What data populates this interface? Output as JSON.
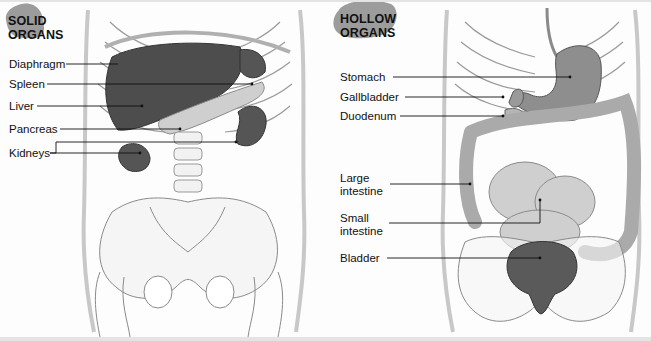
{
  "panels": [
    {
      "heading_line1": "SOLID",
      "heading_line2": "ORGANS",
      "labels": [
        {
          "text": "Diaphragm"
        },
        {
          "text": "Spleen"
        },
        {
          "text": "Liver"
        },
        {
          "text": "Pancreas"
        },
        {
          "text": "Kidneys"
        }
      ]
    },
    {
      "heading_line1": "HOLLOW",
      "heading_line2": "ORGANS",
      "labels": [
        {
          "text": "Stomach"
        },
        {
          "text": "Gallbladder"
        },
        {
          "text": "Duodenum"
        },
        {
          "text": "Large intestine"
        },
        {
          "text": "Small intestine"
        },
        {
          "text": "Bladder"
        }
      ]
    }
  ],
  "colors": {
    "badge": "#9a9a9a",
    "organ_dark": "#4a4a4a",
    "organ_mid": "#8a8a8a",
    "organ_light": "#c8c8c8",
    "bone": "#f4f4f4",
    "outline": "#7a7a7a"
  }
}
